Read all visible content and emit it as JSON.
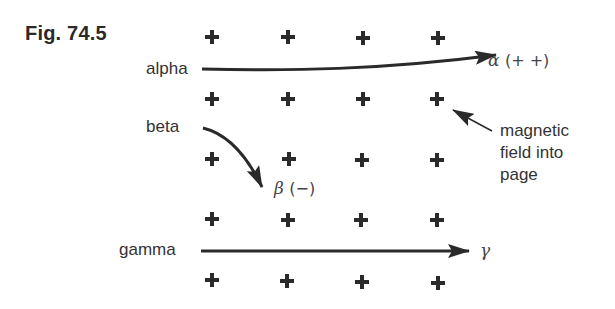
{
  "figure": {
    "title": "Fig. 74.5"
  },
  "rays": [
    {
      "name": "alpha",
      "source_label": "alpha",
      "symbol": "α",
      "charge": "(+ +)",
      "deflection": "slight upward curve"
    },
    {
      "name": "beta",
      "source_label": "beta",
      "symbol": "β",
      "charge": "(−)",
      "deflection": "strong downward curve"
    },
    {
      "name": "gamma",
      "source_label": "gamma",
      "symbol": "γ",
      "charge": "",
      "deflection": "none (straight)"
    }
  ],
  "field": {
    "symbol": "+",
    "rows": 5,
    "columns": 4,
    "annotation_lines": [
      "magnetic",
      "field into",
      "page"
    ]
  },
  "colors": {
    "ink": "#2a2a2a",
    "background": "#ffffff"
  }
}
